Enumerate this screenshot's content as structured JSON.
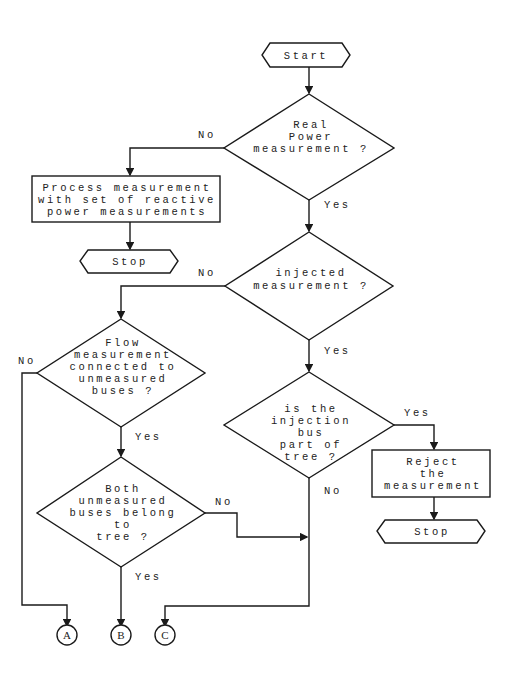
{
  "flowchart": {
    "start": "Start",
    "decision_real_power": [
      "Real",
      "Power",
      "measurement ?"
    ],
    "decision_injected": [
      "injected",
      "measurement ?"
    ],
    "decision_flow": [
      "Flow",
      "measurement",
      "connected to",
      "unmeasured",
      "buses ?"
    ],
    "decision_injection_bus": [
      "is the",
      "injection",
      "bus",
      "part of",
      "tree ?"
    ],
    "decision_both": [
      "Both",
      "unmeasured",
      "buses belong",
      "to",
      "tree ?"
    ],
    "process_reactive": [
      "Process measurement",
      "with set of reactive",
      "power measurements"
    ],
    "process_reject": [
      "Reject",
      "the",
      "measurement"
    ],
    "stop_1": "Stop",
    "stop_2": "Stop",
    "labels": {
      "no": "No",
      "yes": "Yes"
    },
    "connectors": [
      "A",
      "B",
      "C"
    ]
  }
}
